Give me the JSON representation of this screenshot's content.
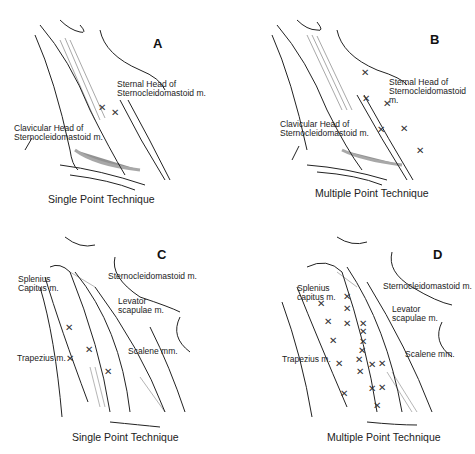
{
  "figure": {
    "panels": [
      {
        "letter": "A",
        "caption": "Single Point Technique",
        "labels": [
          "Sternal Head of\nSternocleidomastoid m.",
          "Clavicular Head of\nSternocleidomastoid m."
        ],
        "markers": [
          [
            102,
            108
          ],
          [
            115,
            113
          ]
        ]
      },
      {
        "letter": "B",
        "caption": "Multiple Point Technique",
        "labels": [
          "Sternal Head of\nSternocleidomastoid m.",
          "Clavicular Head of\nSternocleidomastoid m."
        ],
        "markers": [
          [
            128,
            73
          ],
          [
            129,
            99
          ],
          [
            150,
            104
          ],
          [
            144,
            130
          ],
          [
            167,
            129
          ],
          [
            183,
            151
          ]
        ]
      },
      {
        "letter": "C",
        "caption": "Single Point Technique",
        "labels": [
          "Splenius\nCapitus m.",
          "Sternocleidomastoid m.",
          "Levator\nscapulae m.",
          "Trapezius m.",
          "Scalene mm."
        ],
        "markers": [
          [
            69,
            101
          ],
          [
            89,
            123
          ],
          [
            70,
            132
          ],
          [
            108,
            145
          ]
        ]
      },
      {
        "letter": "D",
        "caption": "Multiple Point Technique",
        "labels": [
          "Splenius\ncapitus m.",
          "Sternocleidomastoid m.",
          "Levator\nscapulae m.",
          "Trapezius m.",
          "Scalene mm."
        ],
        "markers": [
          [
            84,
            75
          ],
          [
            110,
            70
          ],
          [
            110,
            82
          ],
          [
            91,
            95
          ],
          [
            110,
            97
          ],
          [
            126,
            97
          ],
          [
            126,
            104
          ],
          [
            96,
            114
          ],
          [
            126,
            114
          ],
          [
            125,
            123
          ],
          [
            102,
            136
          ],
          [
            122,
            133
          ],
          [
            123,
            145
          ],
          [
            135,
            137
          ],
          [
            145,
            137
          ],
          [
            121,
            144
          ],
          [
            135,
            162
          ],
          [
            145,
            162
          ],
          [
            107,
            167
          ],
          [
            140,
            179
          ]
        ]
      }
    ]
  }
}
